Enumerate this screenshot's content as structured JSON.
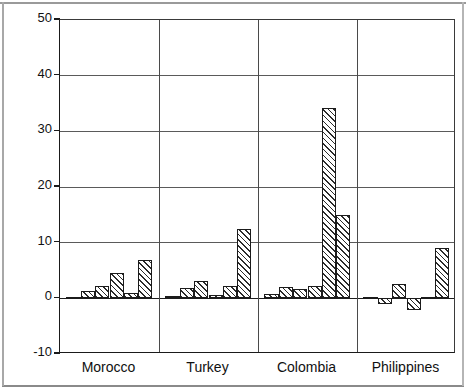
{
  "chart_data": {
    "type": "bar",
    "title": "",
    "subtitle": "",
    "xlabel": "",
    "ylabel": "FDI, in US $ per capita",
    "ylim": [
      -10,
      50
    ],
    "ytick_labels": [
      "50",
      "40",
      "30",
      "20",
      "10",
      "0",
      "-10"
    ],
    "ytick_values": [
      50,
      40,
      30,
      20,
      10,
      0,
      -10
    ],
    "grid": "horizontal",
    "legend": "none",
    "categories": [
      "Morocco",
      "Turkey",
      "Colombia",
      "Philippines"
    ],
    "groups": [
      {
        "label": "Morocco",
        "values": [
          0.3,
          1.4,
          2.2,
          4.6,
          1.0,
          6.8
        ]
      },
      {
        "label": "Turkey",
        "values": [
          0.5,
          1.8,
          3.1,
          0.6,
          2.2,
          12.5
        ]
      },
      {
        "label": "Colombia",
        "values": [
          0.8,
          2.1,
          1.6,
          2.2,
          34.2,
          15.0
        ]
      },
      {
        "label": "Philippines",
        "values": [
          0.2,
          -1.0,
          2.6,
          -2.1,
          0.3,
          9.0
        ]
      }
    ],
    "values_flat": [
      0.3,
      1.4,
      2.2,
      4.6,
      1.0,
      6.8,
      0.5,
      1.8,
      3.1,
      0.6,
      2.2,
      12.5,
      0.8,
      2.1,
      1.6,
      2.2,
      34.2,
      15.0,
      0.2,
      -1.0,
      2.6,
      -2.1,
      0.3,
      9.0
    ],
    "bar_style": {
      "fill": "diagonal-hatch",
      "edge_color": "#1b1b1b",
      "face_color": "#ffffff"
    }
  },
  "axes": {
    "y_title": "FDI, in US $ per capita",
    "ticks": [
      {
        "label": "50",
        "value": 50
      },
      {
        "label": "40",
        "value": 40
      },
      {
        "label": "30",
        "value": 30
      },
      {
        "label": "20",
        "value": 20
      },
      {
        "label": "10",
        "value": 10
      },
      {
        "label": "0",
        "value": 0
      },
      {
        "label": "-10",
        "value": -10
      }
    ],
    "group_labels": [
      "Morocco",
      "Turkey",
      "Colombia",
      "Philippines"
    ]
  }
}
